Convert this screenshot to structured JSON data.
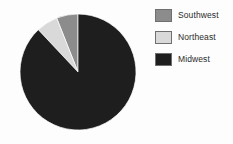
{
  "chart_data": {
    "type": "pie",
    "title": "",
    "subtitle": "",
    "xlabel": "",
    "ylabel": "",
    "grid": false,
    "legend_position": "right",
    "start_angle_deg": 0,
    "direction": "clockwise",
    "categories": [
      "Southwest",
      "Northeast",
      "Midwest"
    ],
    "values": [
      6,
      6,
      88
    ],
    "units": "percent",
    "slices": [
      {
        "label": "Southwest",
        "value": 6,
        "percent": 6,
        "color": "#8c8c8c",
        "start_angle_deg": 338.4,
        "end_angle_deg": 360.0
      },
      {
        "label": "Northeast",
        "value": 6,
        "percent": 6,
        "color": "#d9d9d9",
        "start_angle_deg": 316.8,
        "end_angle_deg": 338.4
      },
      {
        "label": "Midwest",
        "value": 88,
        "percent": 88,
        "color": "#1e1e1e",
        "start_angle_deg": 0.0,
        "end_angle_deg": 316.8
      }
    ],
    "annotations": []
  },
  "legend": {
    "entries": [
      {
        "label": "Southwest",
        "swatch_color": "#8c8c8c",
        "swatch_border": "#6f6f6f"
      },
      {
        "label": "Northeast",
        "swatch_color": "#d9d9d9",
        "swatch_border": "#6f6f6f"
      },
      {
        "label": "Midwest",
        "swatch_color": "#1e1e1e",
        "swatch_border": "#6f6f6f"
      }
    ]
  },
  "colors": {
    "background": "#fdfdfd",
    "southwest": "#8c8c8c",
    "northeast": "#d9d9d9",
    "midwest": "#1e1e1e",
    "legend_text": "#2b2b2b",
    "swatch_border": "#6f6f6f"
  },
  "geometry": {
    "center_x": 78,
    "center_y": 72,
    "radius": 58
  }
}
